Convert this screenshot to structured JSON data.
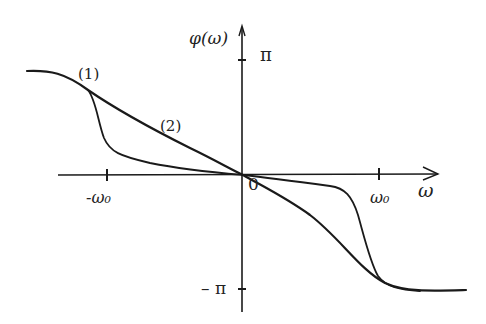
{
  "diagram": {
    "type": "phase-response-sketch",
    "y_axis_label": "φ(ω)",
    "x_axis_label": "ω",
    "y_ticks": [
      {
        "label": "π",
        "value": "pi"
      },
      {
        "label": "– π",
        "value": "-pi"
      }
    ],
    "x_ticks": [
      {
        "label": "-ω₀",
        "value": "-omega0"
      },
      {
        "label": "ω₀",
        "value": "omega0"
      }
    ],
    "origin_label": "0",
    "curves": [
      {
        "id": "1",
        "label": "(1)",
        "description": "steep transition near ±ω₀, nearly flat through origin"
      },
      {
        "id": "2",
        "label": "(2)",
        "description": "gradual smooth transition from π to −π"
      }
    ],
    "colors": {
      "ink": "#1a1a1a",
      "background": "#ffffff"
    }
  }
}
